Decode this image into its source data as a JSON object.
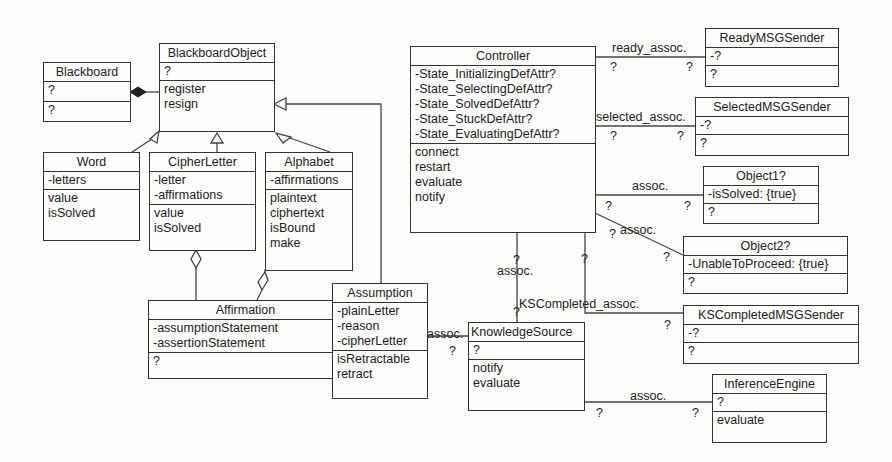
{
  "classes": {
    "blackboard": {
      "name": "Blackboard",
      "attributes": [
        "?"
      ],
      "operations": [
        "?"
      ]
    },
    "blackboard_object": {
      "name": "BlackboardObject",
      "attributes": [
        "?"
      ],
      "operations": [
        "register",
        "resign"
      ]
    },
    "word": {
      "name": "Word",
      "attributes": [
        "-letters"
      ],
      "operations": [
        "value",
        "isSolved"
      ]
    },
    "cipher_letter": {
      "name": "CipherLetter",
      "attributes": [
        "-letter",
        "-affirmations"
      ],
      "operations": [
        "value",
        "isSolved"
      ]
    },
    "alphabet": {
      "name": "Alphabet",
      "attributes": [
        "-affirmations"
      ],
      "operations": [
        "plaintext",
        "ciphertext",
        "isBound",
        "make"
      ]
    },
    "affirmation": {
      "name": "Affirmation",
      "attributes": [
        "-assumptionStatement",
        "-assertionStatement"
      ],
      "operations": [
        "?"
      ]
    },
    "assumption": {
      "name": "Assumption",
      "attributes": [
        "-plainLetter",
        "-reason",
        "-cipherLetter"
      ],
      "operations": [
        "isRetractable",
        "retract"
      ]
    },
    "controller": {
      "name": "Controller",
      "attributes": [
        "-State_InitializingDefAttr?",
        "-State_SelectingDefAttr?",
        "-State_SolvedDefAttr?",
        "-State_StuckDefAttr?",
        "-State_EvaluatingDefAttr?"
      ],
      "operations": [
        "connect",
        "restart",
        "evaluate",
        "notify"
      ]
    },
    "ready_msg_sender": {
      "name": "ReadyMSGSender",
      "attributes": [
        "-?"
      ],
      "operations": [
        "?"
      ]
    },
    "selected_msg_sender": {
      "name": "SelectedMSGSender",
      "attributes": [
        "-?"
      ],
      "operations": [
        "?"
      ]
    },
    "object1": {
      "name": "Object1?",
      "attributes": [
        "-isSolved: {true}"
      ],
      "operations": [
        "?"
      ]
    },
    "object2": {
      "name": "Object2?",
      "attributes": [
        "-UnableToProceed: {true}"
      ],
      "operations": [
        "?"
      ]
    },
    "ks_completed_msg_sender": {
      "name": "KSCompletedMSGSender",
      "attributes": [
        "-?"
      ],
      "operations": [
        "?"
      ]
    },
    "knowledge_source": {
      "name": "KnowledgeSource",
      "attributes": [
        "?"
      ],
      "operations": [
        "notify",
        "evaluate"
      ]
    },
    "inference_engine": {
      "name": "InferenceEngine",
      "attributes": [
        "?"
      ],
      "operations": [
        "evaluate"
      ]
    }
  },
  "associations": {
    "ready": {
      "label": "ready_assoc.",
      "mult_a": "?",
      "mult_b": "?"
    },
    "selected": {
      "label": "selected_assoc.",
      "mult_a": "?",
      "mult_b": "?"
    },
    "object1": {
      "label": "assoc.",
      "mult_a": "?",
      "mult_b": "?"
    },
    "object2": {
      "label": "assoc.",
      "mult_a": "?",
      "mult_b": "?"
    },
    "controller_ks": {
      "label": "assoc.",
      "mult_a": "?",
      "mult_b": "?"
    },
    "ks_completed": {
      "label": "KSCompleted_assoc.",
      "mult_a": "?",
      "mult_b": "?"
    },
    "assumption_ks": {
      "label": "assoc.",
      "mult_a": "?"
    },
    "ks_inference": {
      "label": "assoc.",
      "mult_a": "?",
      "mult_b": "?"
    }
  }
}
